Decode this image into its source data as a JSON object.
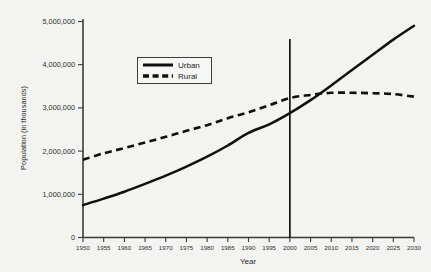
{
  "chart_data": {
    "type": "line",
    "title": "",
    "xlabel": "Year",
    "ylabel": "Population (in thousands)",
    "xlim": [
      1950,
      2030
    ],
    "ylim": [
      0,
      5000000
    ],
    "grid": false,
    "legend_position": "upper-center-left",
    "x": [
      1950,
      1955,
      1960,
      1965,
      1970,
      1975,
      1980,
      1985,
      1990,
      1995,
      2000,
      2005,
      2010,
      2015,
      2020,
      2025,
      2030
    ],
    "x_tick_labels": [
      "1950",
      "1955",
      "1960",
      "1965",
      "1970",
      "1975",
      "1980",
      "1985",
      "1990",
      "1995",
      "2000",
      "2005",
      "2010",
      "2015",
      "2020",
      "2025",
      "2030"
    ],
    "y_tick_labels": [
      "0",
      "1,000,000",
      "2,000,000",
      "3,000,000",
      "4,000,000",
      "5,000,000"
    ],
    "y_ticks": [
      0,
      1000000,
      2000000,
      3000000,
      4000000,
      5000000
    ],
    "series": [
      {
        "name": "Urban",
        "style": "solid",
        "color": "#101010",
        "values": [
          750000,
          900000,
          1060000,
          1240000,
          1430000,
          1640000,
          1870000,
          2130000,
          2420000,
          2620000,
          2880000,
          3180000,
          3520000,
          3880000,
          4230000,
          4580000,
          4900000
        ]
      },
      {
        "name": "Rural",
        "style": "dashed",
        "color": "#101010",
        "values": [
          1800000,
          1950000,
          2070000,
          2200000,
          2330000,
          2470000,
          2600000,
          2760000,
          2900000,
          3060000,
          3230000,
          3300000,
          3350000,
          3350000,
          3340000,
          3320000,
          3260000
        ]
      }
    ],
    "annotations": [
      {
        "type": "vertical-reference-line",
        "x": 2000,
        "label": ""
      }
    ]
  },
  "legend": {
    "entries": [
      {
        "label": "Urban"
      },
      {
        "label": "Rural"
      }
    ]
  },
  "axes": {
    "x_title": "Year",
    "y_title": "Population (in thousands)"
  }
}
